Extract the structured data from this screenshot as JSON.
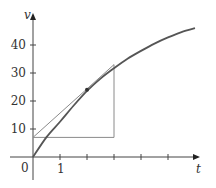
{
  "chart_data": {
    "type": "line",
    "title": "",
    "xlabel": "t",
    "ylabel": "v",
    "xlim": [
      0,
      6.2
    ],
    "ylim": [
      -6,
      50
    ],
    "x_ticks": [
      1,
      2,
      3,
      4,
      5
    ],
    "x_tick_labels": [
      "1",
      "",
      "",
      "",
      ""
    ],
    "y_ticks": [
      10,
      20,
      30,
      40
    ],
    "y_tick_labels": [
      "10",
      "20",
      "30",
      "40"
    ],
    "origin_label": "0",
    "grid": false,
    "legend": null,
    "series": [
      {
        "name": "curve",
        "description": "concave-down increasing curve through the origin",
        "x": [
          0,
          0.5,
          1,
          1.5,
          2,
          2.5,
          3,
          3.5,
          4,
          4.5,
          5,
          5.5,
          6
        ],
        "values": [
          0,
          7.1,
          12.6,
          18.3,
          23.6,
          28.0,
          31.7,
          35.1,
          37.9,
          40.5,
          42.7,
          44.6,
          46.0
        ]
      },
      {
        "name": "tangent line at t=2",
        "x": [
          0,
          3
        ],
        "values": [
          7,
          33
        ]
      }
    ],
    "annotations": [
      {
        "type": "point",
        "x": 2,
        "y": 24,
        "label": ""
      },
      {
        "type": "horizontal-segment",
        "from": [
          0,
          7
        ],
        "to": [
          3,
          7
        ]
      },
      {
        "type": "vertical-segment",
        "from": [
          3,
          7
        ],
        "to": [
          3,
          33
        ]
      }
    ]
  },
  "colors": {
    "curve": "#555555",
    "tangent": "#8a8a8a",
    "axis": "#444444",
    "point": "#333333"
  },
  "plot": {
    "origin_px": [
      33,
      157
    ],
    "x_unit_px": 27,
    "y_unit_px": 2.8
  }
}
